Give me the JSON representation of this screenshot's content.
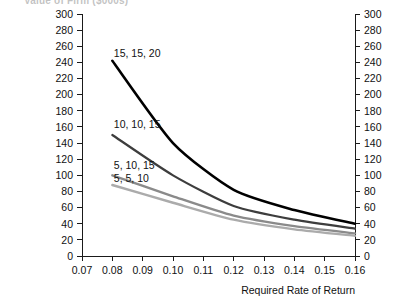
{
  "chart_data": {
    "type": "line",
    "title": "Value of Firm ($000s)",
    "xlabel": "Required Rate of Return",
    "ylabel": "",
    "x": [
      0.08,
      0.1,
      0.12,
      0.14,
      0.16
    ],
    "xlim": [
      0.07,
      0.16
    ],
    "ylim": [
      0,
      300
    ],
    "xticks": [
      "0.07",
      "0.08",
      "0.09",
      "0.10",
      "0.11",
      "0.12",
      "0.13",
      "0.14",
      "0.15",
      "0.16"
    ],
    "xtick_values": [
      0.07,
      0.08,
      0.09,
      0.1,
      0.11,
      0.12,
      0.13,
      0.14,
      0.15,
      0.16
    ],
    "yticks": [
      "0",
      "20",
      "40",
      "60",
      "80",
      "100",
      "120",
      "140",
      "160",
      "180",
      "200",
      "220",
      "240",
      "260",
      "280",
      "300"
    ],
    "ytick_values": [
      0,
      20,
      40,
      60,
      80,
      100,
      120,
      140,
      160,
      180,
      200,
      220,
      240,
      260,
      280,
      300
    ],
    "grid": false,
    "legend_position": "inline-labels",
    "right_axis_mirrored": true,
    "series": [
      {
        "name": "15, 15, 20",
        "color": "#000000",
        "width": 2.6,
        "values": [
          242,
          140,
          82,
          57,
          40
        ],
        "label_x": 0.0805,
        "label_y": 252
      },
      {
        "name": "10, 10, 15",
        "color": "#3d3d3d",
        "width": 2.2,
        "values": [
          150,
          100,
          62,
          45,
          34
        ],
        "label_x": 0.0805,
        "label_y": 163
      },
      {
        "name": "5, 10, 15",
        "color": "#8a8a8a",
        "width": 2.4,
        "values": [
          100,
          74,
          50,
          37,
          28
        ],
        "label_x": 0.0805,
        "label_y": 112
      },
      {
        "name": "5, 5, 10",
        "color": "#ababab",
        "width": 2.4,
        "values": [
          88,
          66,
          45,
          33,
          25
        ],
        "label_x": 0.0805,
        "label_y": 97
      }
    ]
  }
}
